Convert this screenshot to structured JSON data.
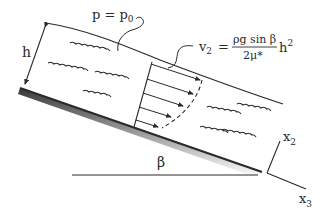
{
  "diagram": {
    "type": "fluid-film-on-inclined-plane",
    "labels": {
      "height": "h",
      "surface_pressure": "p = p",
      "surface_pressure_sub": "0",
      "velocity_lhs": "v",
      "velocity_lhs_sub": "2",
      "velocity_eq": "=",
      "velocity_numerator": "ρg sin β",
      "velocity_denominator": "2μ*",
      "velocity_factor": "h",
      "velocity_factor_exp": "2",
      "angle": "β",
      "axis_2": "x",
      "axis_2_sub": "2",
      "axis_3": "x",
      "axis_3_sub": "3"
    },
    "colors": {
      "ink": "#2a2a2a",
      "background": "#ffffff"
    },
    "profile_arrow_count": 5
  }
}
